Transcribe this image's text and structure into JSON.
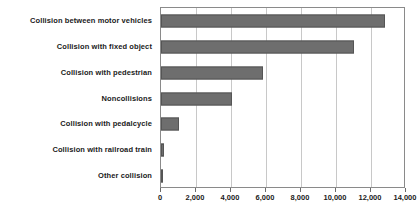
{
  "chart_data": {
    "type": "bar",
    "orientation": "horizontal",
    "title": "",
    "xlabel": "",
    "ylabel": "",
    "categories": [
      "Collision between motor vehicles",
      "Collision with fixed object",
      "Collision with pedestrian",
      "Noncollisions",
      "Collision with pedalcycle",
      "Collision with railroad train",
      "Other collision"
    ],
    "values": [
      12800,
      11000,
      5800,
      4050,
      1000,
      150,
      130
    ],
    "xlim": [
      0,
      14000
    ],
    "xticks": [
      0,
      2000,
      4000,
      6000,
      8000,
      10000,
      12000,
      14000
    ],
    "xtick_labels": [
      "0",
      "2,000",
      "4,000",
      "6,000",
      "8,000",
      "10,000",
      "12,000",
      "14,000"
    ],
    "grid": true,
    "grid_axis": "x",
    "legend": false,
    "bar_color": "#6e6e6e",
    "bar_edge_color": "#555555",
    "grid_color": "#c8c8c8",
    "frame_color": "#8a8a8a",
    "text_color": "#1a1a1a",
    "background": "#ffffff"
  }
}
